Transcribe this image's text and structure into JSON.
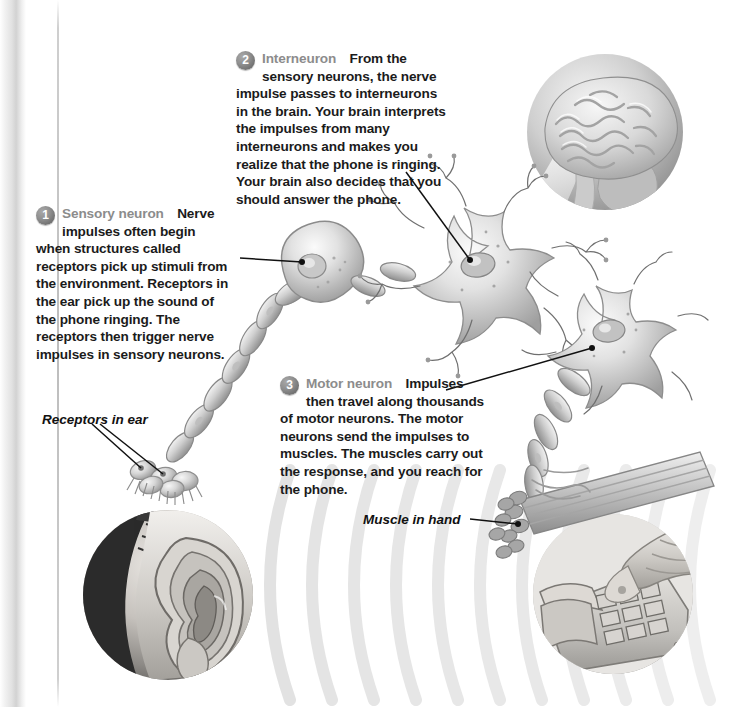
{
  "figure": {
    "kind": "biology-diagram"
  },
  "callouts": [
    {
      "number": "1",
      "term": "Sensory neuron",
      "text": "Nerve impulses often begin when structures called receptors pick up stimuli from the environment. Receptors in the ear pick up the sound of the phone ringing. The receptors then trigger nerve impulses in sensory neurons."
    },
    {
      "number": "2",
      "term": "Interneuron",
      "text": "From the sensory neurons, the nerve impulse passes to interneurons in the brain. Your brain interprets the impulses from many interneurons and makes you realize that the phone is ringing. Your brain also decides that you should answer the phone."
    },
    {
      "number": "3",
      "term": "Motor neuron",
      "text": "Impulses then travel along thousands of motor neurons. The motor neurons send the impulses to muscles. The muscles carry out the response, and you reach for the phone."
    }
  ],
  "leader_labels": [
    {
      "text": "Receptors in ear"
    },
    {
      "text": "Muscle in hand"
    }
  ],
  "illustrations": [
    {
      "name": "brain-inset",
      "caption_hidden": "human brain in circular inset"
    },
    {
      "name": "ear-inset",
      "caption_hidden": "human ear in circular inset with sound waves"
    },
    {
      "name": "hand-phone-inset",
      "caption_hidden": "hand reaching for telephone keypad"
    },
    {
      "name": "sensory-neuron",
      "caption_hidden": "sensory neuron cell body with myelinated axon"
    },
    {
      "name": "interneuron",
      "caption_hidden": "star-shaped interneuron with many dendrites"
    },
    {
      "name": "motor-neuron",
      "caption_hidden": "motor neuron with myelinated axon to muscle"
    },
    {
      "name": "hair-cell-receptors",
      "caption_hidden": "hair cell receptors with cilia"
    },
    {
      "name": "muscle-bundle",
      "caption_hidden": "skeletal muscle fiber bundle"
    }
  ],
  "colors": {
    "page_background": "#ffffff",
    "text": "#1b1b1b",
    "term_gray": "#8c8c8c",
    "badge_gray": "#6e6e6e",
    "art_gray": "#9a9a9a",
    "leader_line": "#111111",
    "soundwave_gray": "#dcdcdc"
  }
}
